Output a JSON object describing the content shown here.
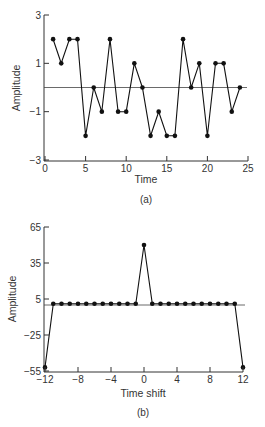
{
  "chart_data": [
    {
      "id": "a",
      "type": "line",
      "caption": "(a)",
      "xlabel": "Time",
      "ylabel": "Amplitude",
      "xlim": [
        0,
        25
      ],
      "ylim": [
        -3,
        3
      ],
      "xticks": [
        0,
        5,
        10,
        15,
        20,
        25
      ],
      "xtick_labels": [
        "0",
        "5",
        "10",
        "15",
        "20",
        "25"
      ],
      "yticks": [
        3,
        1,
        -1,
        -3
      ],
      "ytick_labels": [
        "3",
        "1",
        "−1",
        "−3"
      ],
      "reference_line_y": 0,
      "markers": true,
      "grid": false,
      "x": [
        1,
        2,
        3,
        4,
        5,
        6,
        7,
        8,
        9,
        10,
        11,
        12,
        13,
        14,
        15,
        16,
        17,
        18,
        19,
        20,
        21,
        22,
        23,
        24
      ],
      "values": [
        2,
        1,
        2,
        2,
        -2,
        0,
        -1,
        2,
        -1,
        -1,
        1,
        0,
        -2,
        -1,
        -2,
        -2,
        2,
        0,
        1,
        -2,
        1,
        1,
        -1,
        0
      ]
    },
    {
      "id": "b",
      "type": "line",
      "caption": "(b)",
      "xlabel": "Time shift",
      "ylabel": "Amplitude",
      "xlim": [
        -12,
        12
      ],
      "ylim": [
        -55,
        65
      ],
      "xticks": [
        -12,
        -8,
        -4,
        0,
        4,
        8,
        12
      ],
      "xtick_labels": [
        "−12",
        "−8",
        "−4",
        "0",
        "4",
        "8",
        "12"
      ],
      "yticks": [
        65,
        35,
        5,
        -25,
        -55
      ],
      "ytick_labels": [
        "65",
        "35",
        "5",
        "−25",
        "−55"
      ],
      "reference_line_y": 0,
      "markers": true,
      "grid": false,
      "x": [
        -12,
        -11,
        -10,
        -9,
        -8,
        -7,
        -6,
        -5,
        -4,
        -3,
        -2,
        -1,
        0,
        1,
        2,
        3,
        4,
        5,
        6,
        7,
        8,
        9,
        10,
        11,
        12
      ],
      "values": [
        -52,
        1,
        1,
        1,
        1,
        1,
        1,
        1,
        1,
        1,
        1,
        1,
        50,
        1,
        1,
        1,
        1,
        1,
        1,
        1,
        1,
        1,
        1,
        1,
        -52
      ]
    }
  ]
}
